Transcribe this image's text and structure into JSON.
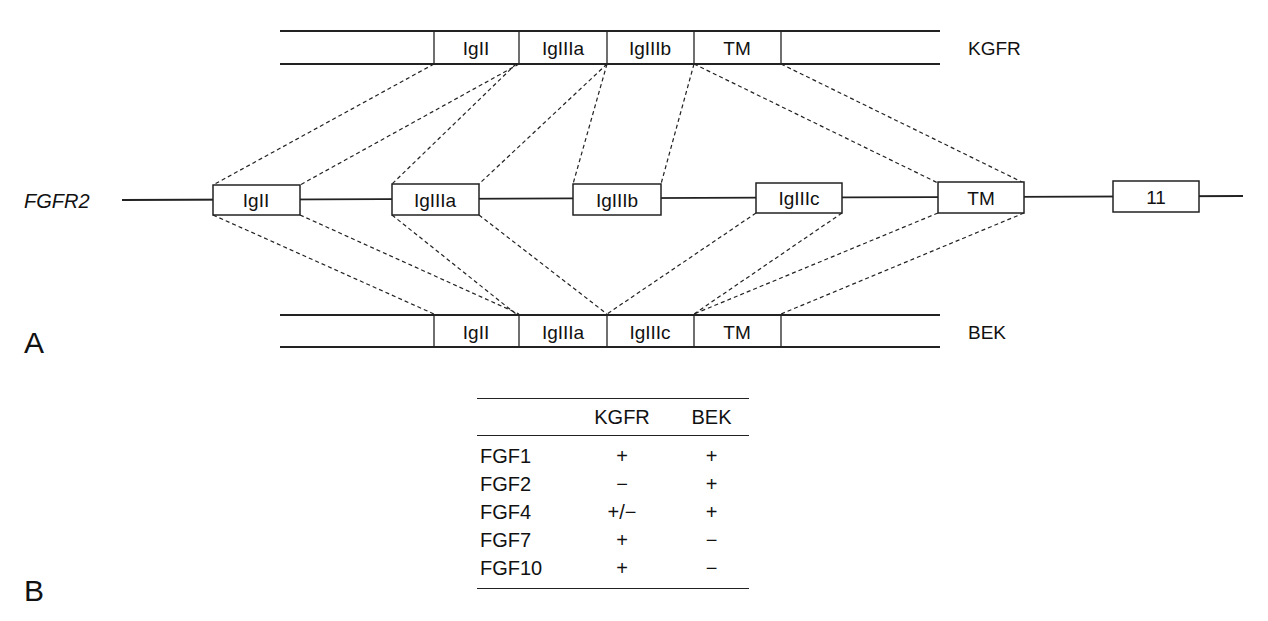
{
  "panel_a": {
    "label": "A",
    "gene": {
      "name": "FGFR2",
      "exons": [
        {
          "id": "IgII",
          "label": "IgII"
        },
        {
          "id": "IgIIIa",
          "label": "IgIIIa"
        },
        {
          "id": "IgIIIb",
          "label": "IgIIIb"
        },
        {
          "id": "IgIIIc",
          "label": "IgIIIc"
        },
        {
          "id": "TM",
          "label": "TM"
        },
        {
          "id": "11",
          "label": "11"
        }
      ]
    },
    "isoforms": [
      {
        "name": "KGFR",
        "position": "top",
        "domains": [
          "IgII",
          "IgIIIa",
          "IgIIIb",
          "TM"
        ]
      },
      {
        "name": "BEK",
        "position": "bottom",
        "domains": [
          "IgII",
          "IgIIIa",
          "IgIIIc",
          "TM"
        ]
      }
    ]
  },
  "panel_b": {
    "label": "B",
    "table": {
      "headers": [
        "",
        "KGFR",
        "BEK"
      ],
      "rows": [
        {
          "ligand": "FGF1",
          "KGFR": "+",
          "BEK": "+"
        },
        {
          "ligand": "FGF2",
          "KGFR": "−",
          "BEK": "+"
        },
        {
          "ligand": "FGF4",
          "KGFR": "+/−",
          "BEK": "+"
        },
        {
          "ligand": "FGF7",
          "KGFR": "+",
          "BEK": "−"
        },
        {
          "ligand": "FGF10",
          "KGFR": "+",
          "BEK": "−"
        }
      ]
    }
  }
}
